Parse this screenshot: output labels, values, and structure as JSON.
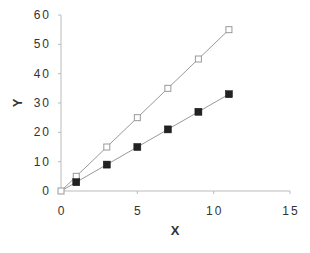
{
  "chart_data": {
    "type": "scatter",
    "title": "",
    "xlabel": "X",
    "ylabel": "Y",
    "xlim": [
      0,
      15
    ],
    "ylim": [
      0,
      60
    ],
    "xticks": [
      0,
      5,
      10,
      15
    ],
    "yticks": [
      0,
      10,
      20,
      30,
      40,
      50,
      60
    ],
    "grid": false,
    "legend": null,
    "series": [
      {
        "name": "open-squares",
        "marker": "square-open",
        "line": true,
        "color": "#999999",
        "x": [
          0,
          1,
          3,
          5,
          7,
          9,
          11
        ],
        "y": [
          0,
          5,
          15,
          25,
          35,
          45,
          55
        ]
      },
      {
        "name": "filled-squares",
        "marker": "square-filled",
        "line": true,
        "color": "#222222",
        "x": [
          0,
          1,
          3,
          5,
          7,
          9,
          11
        ],
        "y": [
          0,
          3,
          9,
          15,
          21,
          27,
          33
        ]
      }
    ]
  },
  "axes": {
    "x_label": "X",
    "y_label": "Y",
    "x_tick_labels": [
      "0",
      "5",
      "10",
      "15"
    ],
    "y_tick_labels": [
      "0",
      "10",
      "20",
      "30",
      "40",
      "50",
      "60"
    ]
  }
}
